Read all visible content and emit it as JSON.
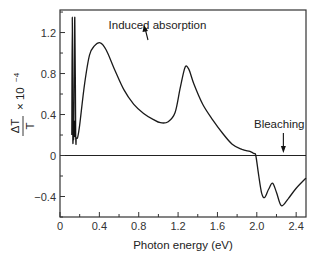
{
  "chart_data": {
    "type": "line",
    "title": "",
    "xlabel": "Photon energy (eV)",
    "ylabel": "ΔT/T × 10^-4",
    "ylabel_parts": {
      "numerator": "ΔT",
      "denominator": "T",
      "multiplier": "× 10",
      "exponent": "−4"
    },
    "xlim": [
      0,
      2.5
    ],
    "ylim": [
      -0.6,
      1.42
    ],
    "grid": false,
    "legend": null,
    "xticks": [
      0,
      0.4,
      0.8,
      1.2,
      1.6,
      2.0,
      2.4
    ],
    "xtick_labels": [
      "0",
      "0.4",
      "0.8",
      "1.2",
      "1.6",
      "2.0",
      "2.4"
    ],
    "yticks": [
      -0.4,
      0,
      0.4,
      0.8,
      1.2
    ],
    "ytick_labels": [
      "−0.4",
      "0",
      "0.4",
      "0.8",
      "1.2"
    ],
    "series": [
      {
        "name": "ΔT/T spectrum",
        "x": [
          0.12,
          0.125,
          0.13,
          0.135,
          0.14,
          0.15,
          0.16,
          0.165,
          0.17,
          0.18,
          0.2,
          0.25,
          0.3,
          0.35,
          0.41,
          0.47,
          0.55,
          0.65,
          0.75,
          0.85,
          0.95,
          1.02,
          1.1,
          1.17,
          1.22,
          1.27,
          1.31,
          1.36,
          1.45,
          1.55,
          1.65,
          1.75,
          1.85,
          1.93,
          1.97,
          1.99,
          2.02,
          2.05,
          2.08,
          2.12,
          2.16,
          2.2,
          2.25,
          2.32,
          2.4,
          2.5
        ],
        "y": [
          0.2,
          1.35,
          0.2,
          0.2,
          0.25,
          1.35,
          0.2,
          0.17,
          0.17,
          0.18,
          0.3,
          0.7,
          0.98,
          1.07,
          1.1,
          1.03,
          0.85,
          0.64,
          0.5,
          0.41,
          0.35,
          0.32,
          0.33,
          0.42,
          0.65,
          0.86,
          0.84,
          0.7,
          0.5,
          0.35,
          0.22,
          0.11,
          0.06,
          0.04,
          0.02,
          0.0,
          -0.2,
          -0.37,
          -0.41,
          -0.33,
          -0.27,
          -0.36,
          -0.49,
          -0.42,
          -0.32,
          -0.22
        ]
      }
    ],
    "annotations": [
      {
        "text": "Induced absorption",
        "x": 0.9,
        "y": 1.27,
        "arrow_to": {
          "x": 0.86,
          "y": 1.2
        }
      },
      {
        "text": "Bleaching",
        "x": 2.2,
        "y": 0.2,
        "arrow_to": {
          "x": 2.27,
          "y": 0.0
        }
      }
    ],
    "reference_lines": [
      {
        "type": "horizontal",
        "y": 0
      }
    ]
  }
}
